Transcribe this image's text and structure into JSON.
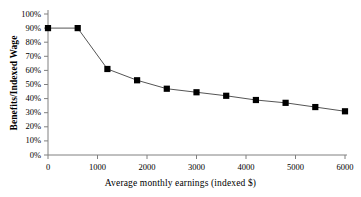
{
  "chart_data": {
    "type": "line",
    "title": "",
    "subtitle": "",
    "xlabel": "Average monthly earnings (indexed $)",
    "ylabel": "Benefits/Indexed Wage",
    "xlim": [
      0,
      6000
    ],
    "ylim": [
      0,
      1.0
    ],
    "grid": false,
    "legend": "none",
    "marker": "filled-square",
    "line_color": "#555555",
    "marker_color": "#000000",
    "axis_color": "#808080",
    "x_tick_labels": [
      "0",
      "1000",
      "2000",
      "3000",
      "4000",
      "5000",
      "6000"
    ],
    "x_tick_values": [
      0,
      1000,
      2000,
      3000,
      4000,
      5000,
      6000
    ],
    "y_tick_labels": [
      "0%",
      "10%",
      "20%",
      "30%",
      "40%",
      "50%",
      "60%",
      "70%",
      "80%",
      "90%",
      "100%"
    ],
    "y_tick_values": [
      0,
      0.1,
      0.2,
      0.3,
      0.4,
      0.5,
      0.6,
      0.7,
      0.8,
      0.9,
      1.0
    ],
    "series": [
      {
        "name": "Benefits/Indexed Wage",
        "x": [
          0,
          600,
          1200,
          1800,
          2400,
          3000,
          3600,
          4200,
          4800,
          5400,
          6000
        ],
        "values": [
          0.9,
          0.9,
          0.61,
          0.53,
          0.47,
          0.445,
          0.42,
          0.39,
          0.37,
          0.34,
          0.31
        ]
      }
    ]
  }
}
